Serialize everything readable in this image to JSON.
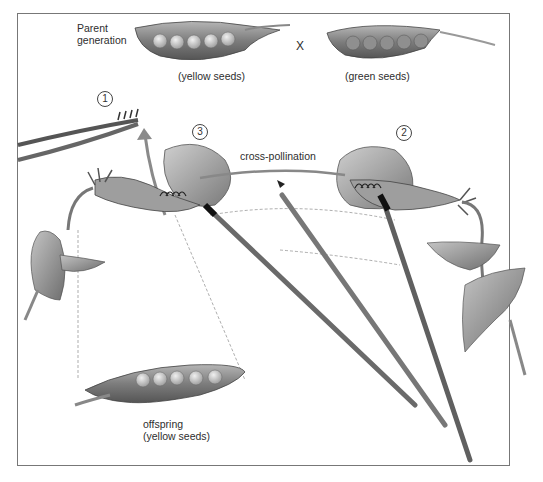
{
  "figure": {
    "parent_label": "Parent\ngeneration",
    "cross_symbol": "X",
    "parent_left_caption": "(yellow seeds)",
    "parent_right_caption": "(green seeds)",
    "process_label": "cross-pollination",
    "offspring_label": "offspring",
    "offspring_caption": "(yellow seeds)",
    "steps": [
      {
        "number": "1",
        "description": "stamens removed with forceps"
      },
      {
        "number": "2",
        "description": "pollen collected from green-seed flower"
      },
      {
        "number": "3",
        "description": "pollen transferred to stigma of yellow-seed flower"
      }
    ]
  },
  "colors": {
    "frame": "#777777",
    "ink": "#333333",
    "pod": "#8a8a8a",
    "seed": "#c9c9c9",
    "petal": "#a8a8a8",
    "brush": "#6a6a6a",
    "leaf": "#9a9a9a"
  }
}
